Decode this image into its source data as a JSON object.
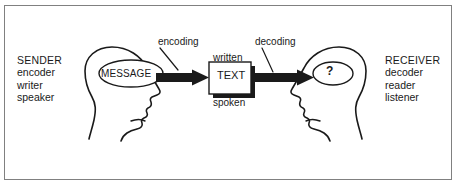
{
  "diagram": {
    "frame": {
      "border_color": "#808080",
      "background": "#ffffff"
    },
    "ink_color": "#1a1a1a",
    "sender": {
      "role": "SENDER",
      "roles": [
        "SENDER",
        "encoder",
        "writer",
        "speaker"
      ],
      "thought_bubble": "MESSAGE",
      "head_icon": "head-profile-right-icon"
    },
    "receiver": {
      "role": "RECEIVER",
      "roles": [
        "RECEIVER",
        "decoder",
        "reader",
        "listener"
      ],
      "thought_bubble": "?",
      "head_icon": "head-profile-left-icon"
    },
    "channel": {
      "box_label": "TEXT",
      "above_label": "written",
      "below_label": "spoken"
    },
    "arrows": [
      {
        "name": "encoding",
        "label": "encoding",
        "from": "MESSAGE",
        "to": "TEXT"
      },
      {
        "name": "decoding",
        "label": "decoding",
        "from": "TEXT",
        "to": "?"
      }
    ]
  }
}
